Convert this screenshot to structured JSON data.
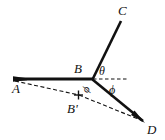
{
  "figure": {
    "type": "geometry-diagram",
    "background_color": "#ffffff",
    "stroke_color": "#111111",
    "width": 165,
    "height": 140
  },
  "labels": {
    "A": "A",
    "B": "B",
    "B_prime": "B'",
    "C": "C",
    "D": "D",
    "theta": "θ",
    "phi": "ϕ",
    "psi": "ϕ"
  },
  "points": {
    "A": {
      "x": 14,
      "y": 79
    },
    "B": {
      "x": 93,
      "y": 79
    },
    "Bp": {
      "x": 78,
      "y": 95
    },
    "C": {
      "x": 121,
      "y": 20
    },
    "D": {
      "x": 144,
      "y": 122
    },
    "H": {
      "x": 126,
      "y": 79
    }
  },
  "label_positions": {
    "A": {
      "x": 12,
      "y": 93
    },
    "B": {
      "x": 74,
      "y": 73
    },
    "Bp": {
      "x": 68,
      "y": 112
    },
    "C": {
      "x": 120,
      "y": 15
    },
    "D": {
      "x": 148,
      "y": 133
    },
    "theta": {
      "x": 99,
      "y": 74
    },
    "phi": {
      "x": 110,
      "y": 92
    },
    "psi": {
      "x": 89,
      "y": 91
    }
  },
  "segments": [
    {
      "name": "segment-AB",
      "from": "A",
      "to": "B",
      "style": "solid",
      "weight": "thick"
    },
    {
      "name": "segment-BC",
      "from": "B",
      "to": "C",
      "style": "solid",
      "weight": "thick"
    },
    {
      "name": "segment-BD",
      "from": "B",
      "to": "D",
      "style": "solid",
      "weight": "thick"
    },
    {
      "name": "segment-BH",
      "from": "B",
      "to": "H",
      "style": "dashed",
      "weight": "thin"
    },
    {
      "name": "segment-ABp",
      "from": "A",
      "to": "Bp",
      "style": "dashed",
      "weight": "thin"
    },
    {
      "name": "segment-BpD",
      "from": "Bp",
      "to": "D",
      "style": "dashed",
      "weight": "thin"
    }
  ],
  "markers": {
    "b_prime_tick": {
      "x": 78,
      "y": 95,
      "size": 5,
      "label": "tick-mark"
    }
  }
}
